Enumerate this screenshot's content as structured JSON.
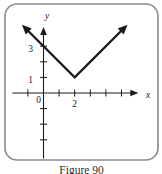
{
  "figure": {
    "caption": "Figure 90",
    "background": "#ffffff",
    "border_color": "#8a8a8a",
    "line_color": "#1a1a1a",
    "caption_color": "#2f2f2f"
  },
  "chart_data": {
    "type": "line",
    "title": "Figure 90",
    "xlabel": "x",
    "ylabel": "y",
    "origin_label": "0",
    "grid": false,
    "xlim": [
      -2,
      5.95
    ],
    "ylim": [
      -4.2,
      4.1
    ],
    "x_ticks": [
      {
        "value": -1,
        "label": ""
      },
      {
        "value": 1,
        "label": ""
      },
      {
        "value": 2,
        "label": "2"
      },
      {
        "value": 3,
        "label": ""
      },
      {
        "value": 4,
        "label": ""
      },
      {
        "value": 5,
        "label": ""
      }
    ],
    "y_ticks": [
      {
        "value": 3,
        "label": "3"
      },
      {
        "value": 2,
        "label": ""
      },
      {
        "value": 1,
        "label": "1"
      },
      {
        "value": -1,
        "label": ""
      },
      {
        "value": -2,
        "label": ""
      },
      {
        "value": -3,
        "label": ""
      }
    ],
    "series": [
      {
        "name": "v-graph",
        "points": [
          [
            -1.25,
            4.25
          ],
          [
            2,
            1
          ],
          [
            5.25,
            4.25
          ]
        ],
        "arrow_start": true,
        "arrow_end": true
      }
    ],
    "key_points": {
      "vertex": [
        2,
        1
      ],
      "y_intercept": [
        0,
        3
      ]
    }
  }
}
